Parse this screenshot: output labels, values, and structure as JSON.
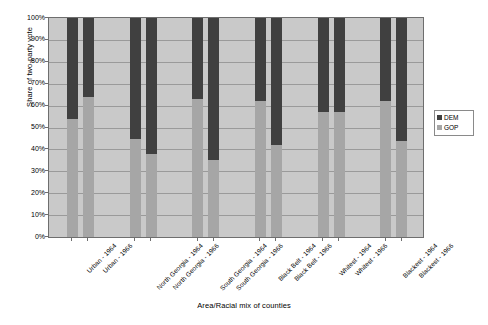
{
  "chart_data": {
    "type": "bar",
    "stacked": true,
    "title": "",
    "xlabel": "Area/Racial mix of counties",
    "ylabel": "Share of two-party vote",
    "ylim": [
      0,
      100
    ],
    "ytick_labels": [
      "100%",
      "90%",
      "80%",
      "70%",
      "60%",
      "50%",
      "40%",
      "30%",
      "20%",
      "10%",
      "0%"
    ],
    "ytick_values": [
      100,
      90,
      80,
      70,
      60,
      50,
      40,
      30,
      20,
      10,
      0
    ],
    "grid": true,
    "legend_position": "right",
    "categories": [
      "Urban - 1964",
      "Urban - 1966",
      "North Georgia - 1964",
      "North Georgia - 1966",
      "South Georgia - 1964",
      "South Georgia - 1966",
      "Black Belt - 1964",
      "Black Belt - 1966",
      "Whitest - 1964",
      "Whitest - 1966",
      "Blackest - 1964",
      "Blackest - 1966"
    ],
    "series": [
      {
        "name": "DEM",
        "color": "#404040",
        "values": [
          46,
          36,
          55,
          62,
          37,
          65,
          38,
          58,
          43,
          43,
          38,
          56
        ]
      },
      {
        "name": "GOP",
        "color": "#a6a6a6",
        "values": [
          54,
          64,
          45,
          38,
          63,
          35,
          62,
          42,
          57,
          57,
          62,
          44
        ]
      }
    ]
  },
  "legend": {
    "entries": [
      {
        "label": "DEM",
        "color": "#404040"
      },
      {
        "label": "GOP",
        "color": "#a6a6a6"
      }
    ]
  },
  "colors": {
    "plot_background": "#c9c9c9",
    "gridline": "#9a9a9a",
    "axis": "#6e6e6e",
    "dem": "#404040",
    "gop": "#a6a6a6",
    "page_background": "#ffffff"
  }
}
